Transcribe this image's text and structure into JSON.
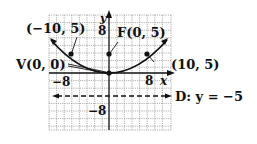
{
  "diagram": {
    "type": "parabola-graph",
    "equation_hint": "x^2 = 20y",
    "axes": {
      "x_label": "x",
      "y_label": "y",
      "x_tick_positive": "8",
      "x_tick_negative": "−8",
      "y_tick_positive": "8",
      "y_tick_negative": "−8",
      "grid_step_units": 2,
      "x_range": [
        -16,
        16
      ],
      "y_range": [
        -14,
        16
      ]
    },
    "points": {
      "vertex": {
        "label": "V(0, 0)",
        "x": 0,
        "y": 0
      },
      "focus": {
        "label": "F(0, 5)",
        "x": 0,
        "y": 5
      },
      "left": {
        "label": "(−10, 5)",
        "x": -10,
        "y": 5
      },
      "right": {
        "label": "(10, 5)",
        "x": 10,
        "y": 5
      }
    },
    "directrix": {
      "label": "D: y = −5",
      "y": -5
    },
    "colors": {
      "grid": "#9a9a9a",
      "ink": "#111111",
      "background": "#ffffff"
    }
  }
}
